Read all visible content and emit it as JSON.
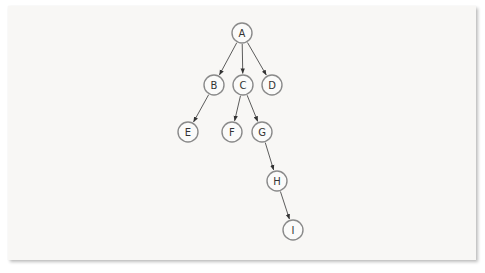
{
  "diagram": {
    "type": "tree",
    "directed": true,
    "nodes": [
      {
        "id": "A",
        "label": "A",
        "x": 242,
        "y": 33
      },
      {
        "id": "B",
        "label": "B",
        "x": 214,
        "y": 85
      },
      {
        "id": "C",
        "label": "C",
        "x": 243,
        "y": 85
      },
      {
        "id": "D",
        "label": "D",
        "x": 272,
        "y": 85
      },
      {
        "id": "E",
        "label": "E",
        "x": 188,
        "y": 132
      },
      {
        "id": "F",
        "label": "F",
        "x": 232,
        "y": 132
      },
      {
        "id": "G",
        "label": "G",
        "x": 262,
        "y": 132
      },
      {
        "id": "H",
        "label": "H",
        "x": 277,
        "y": 181
      },
      {
        "id": "I",
        "label": "I",
        "x": 293,
        "y": 230
      }
    ],
    "edges": [
      {
        "from": "A",
        "to": "B"
      },
      {
        "from": "A",
        "to": "C"
      },
      {
        "from": "A",
        "to": "D"
      },
      {
        "from": "B",
        "to": "E"
      },
      {
        "from": "C",
        "to": "F"
      },
      {
        "from": "C",
        "to": "G"
      },
      {
        "from": "G",
        "to": "H"
      },
      {
        "from": "H",
        "to": "I"
      }
    ],
    "node_radius": 10,
    "colors": {
      "background": "#f8f7f5",
      "node_stroke": "#8a8a8a",
      "edge": "#4a4a4a",
      "label": "#333333"
    }
  }
}
